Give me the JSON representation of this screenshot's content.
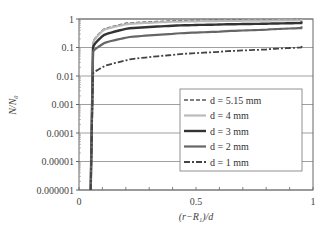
{
  "chart_data": {
    "type": "line",
    "title": "",
    "xlabel": "(r−R₁)/d",
    "ylabel": "N/N₀",
    "xlim": [
      0,
      1
    ],
    "ylim": [
      1e-06,
      1
    ],
    "yscale": "log",
    "grid": "horizontal at decades",
    "legend_position": "inside lower-right",
    "x_ticks": [
      "0",
      "0.5",
      "1"
    ],
    "y_ticks": [
      "0.000001",
      "0.00001",
      "0.0001",
      "0.001",
      "0.01",
      "0.1",
      "1"
    ],
    "series": [
      {
        "name": "d = 5.15 mm",
        "style": "dashed",
        "color": "#555555",
        "x": [
          0.05,
          0.06,
          0.1,
          0.2,
          0.4,
          0.6,
          0.8,
          0.95
        ],
        "values": [
          1e-06,
          0.15,
          0.4,
          0.7,
          0.85,
          0.9,
          0.93,
          0.95
        ]
      },
      {
        "name": "d = 4 mm",
        "style": "solid",
        "color": "#bbbbbb",
        "x": [
          0.05,
          0.06,
          0.1,
          0.2,
          0.4,
          0.6,
          0.8,
          0.95
        ],
        "values": [
          1e-06,
          0.14,
          0.38,
          0.65,
          0.8,
          0.85,
          0.88,
          0.9
        ]
      },
      {
        "name": "d = 3 mm",
        "style": "solid",
        "color": "#333333",
        "x": [
          0.05,
          0.06,
          0.1,
          0.2,
          0.4,
          0.6,
          0.8,
          0.95
        ],
        "values": [
          1e-06,
          0.1,
          0.25,
          0.45,
          0.58,
          0.64,
          0.68,
          0.72
        ]
      },
      {
        "name": "d = 2 mm",
        "style": "solid",
        "color": "#666666",
        "x": [
          0.05,
          0.06,
          0.1,
          0.2,
          0.4,
          0.6,
          0.8,
          0.95
        ],
        "values": [
          1e-06,
          0.07,
          0.13,
          0.22,
          0.3,
          0.36,
          0.42,
          0.48
        ]
      },
      {
        "name": "d = 1 mm",
        "style": "dash-dot",
        "color": "#444444",
        "x": [
          0.05,
          0.06,
          0.1,
          0.2,
          0.4,
          0.6,
          0.8,
          0.95
        ],
        "values": [
          1e-06,
          0.012,
          0.02,
          0.035,
          0.055,
          0.07,
          0.085,
          0.1
        ]
      }
    ]
  },
  "axes": {
    "xlabel": "(r−R₁)/d",
    "ylabel": "N/N₀"
  }
}
